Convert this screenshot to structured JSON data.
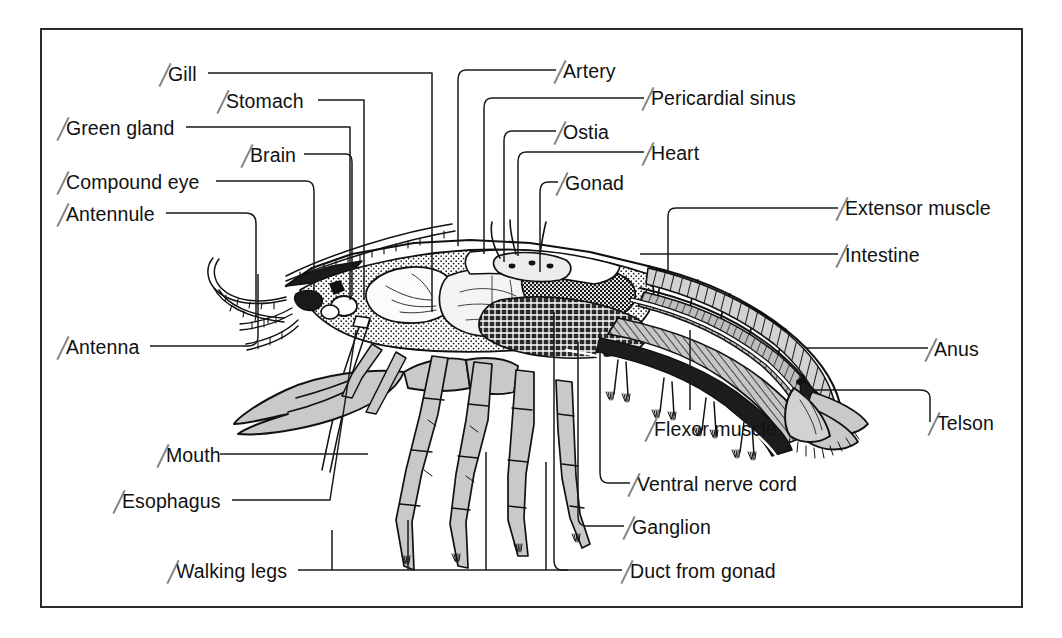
{
  "figure": {
    "frame_color": "#2b2b2b",
    "background_color": "#ffffff",
    "ink_color": "#111111",
    "fill_gray": "#c9c9c9",
    "leader_color": "#1a1a1a"
  },
  "labels": [
    {
      "id": "gill",
      "text": "Gill",
      "align": "left",
      "x": 168,
      "y": 79,
      "tick": true
    },
    {
      "id": "stomach",
      "text": "Stomach",
      "align": "left",
      "x": 226,
      "y": 106,
      "tick": true
    },
    {
      "id": "green-gland",
      "text": "Green gland",
      "align": "left",
      "x": 66,
      "y": 133,
      "tick": true
    },
    {
      "id": "brain",
      "text": "Brain",
      "align": "left",
      "x": 250,
      "y": 160,
      "tick": true
    },
    {
      "id": "compound-eye",
      "text": "Compound eye",
      "align": "left",
      "x": 66,
      "y": 187,
      "tick": true
    },
    {
      "id": "antennule",
      "text": "Antennule",
      "align": "left",
      "x": 66,
      "y": 219,
      "tick": true
    },
    {
      "id": "antenna",
      "text": "Antenna",
      "align": "left",
      "x": 66,
      "y": 352,
      "tick": true
    },
    {
      "id": "mouth",
      "text": "Mouth",
      "align": "left",
      "x": 166,
      "y": 460,
      "tick": true
    },
    {
      "id": "esophagus",
      "text": "Esophagus",
      "align": "left",
      "x": 122,
      "y": 506,
      "tick": true
    },
    {
      "id": "walking-legs",
      "text": "Walking legs",
      "align": "left",
      "x": 176,
      "y": 576,
      "tick": true
    },
    {
      "id": "artery",
      "text": "Artery",
      "align": "left",
      "x": 563,
      "y": 76,
      "tick": true
    },
    {
      "id": "pericardial-sinus",
      "text": "Pericardial sinus",
      "align": "left",
      "x": 651,
      "y": 103,
      "tick": true
    },
    {
      "id": "ostia",
      "text": "Ostia",
      "align": "left",
      "x": 563,
      "y": 137,
      "tick": true
    },
    {
      "id": "heart",
      "text": "Heart",
      "align": "left",
      "x": 651,
      "y": 158,
      "tick": true
    },
    {
      "id": "gonad",
      "text": "Gonad",
      "align": "left",
      "x": 565,
      "y": 188,
      "tick": true
    },
    {
      "id": "extensor-muscle",
      "text": "Extensor muscle",
      "align": "left",
      "x": 845,
      "y": 213,
      "tick": true
    },
    {
      "id": "intestine",
      "text": "Intestine",
      "align": "left",
      "x": 845,
      "y": 260,
      "tick": true
    },
    {
      "id": "anus",
      "text": "Anus",
      "align": "left",
      "x": 934,
      "y": 354,
      "tick": true
    },
    {
      "id": "telson",
      "text": "Telson",
      "align": "left",
      "x": 937,
      "y": 428,
      "tick": true
    },
    {
      "id": "flexor-muscle",
      "text": "Flexor muscle",
      "align": "left",
      "x": 654,
      "y": 434,
      "tick": true
    },
    {
      "id": "ventral-nerve-cord",
      "text": "Ventral nerve cord",
      "align": "left",
      "x": 637,
      "y": 489,
      "tick": true
    },
    {
      "id": "ganglion",
      "text": "Ganglion",
      "align": "left",
      "x": 632,
      "y": 532,
      "tick": true
    },
    {
      "id": "duct-from-gonad",
      "text": "Duct from gonad",
      "align": "left",
      "x": 630,
      "y": 576,
      "tick": true
    }
  ]
}
